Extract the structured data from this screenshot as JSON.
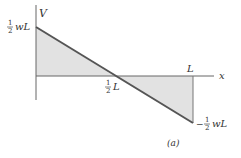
{
  "diagram": {
    "type": "shear-force-diagram",
    "caption": "(a)",
    "axes": {
      "vertical_label": "V",
      "horizontal_label": "x"
    },
    "labels": {
      "max_value_num": "1",
      "max_value_den": "2",
      "max_value_suffix": "wL",
      "min_value_sign": "−",
      "min_value_num": "1",
      "min_value_den": "2",
      "min_value_suffix": "wL",
      "mid_num": "1",
      "mid_den": "2",
      "mid_suffix": "L",
      "end_label": "L"
    },
    "data": {
      "points": [
        {
          "x": "0",
          "V": "1/2 wL"
        },
        {
          "x": "1/2 L",
          "V": "0"
        },
        {
          "x": "L",
          "V": "-1/2 wL"
        }
      ]
    },
    "colors": {
      "line": "#555555",
      "fill": "#e2e2e2",
      "axis": "#666666"
    }
  }
}
